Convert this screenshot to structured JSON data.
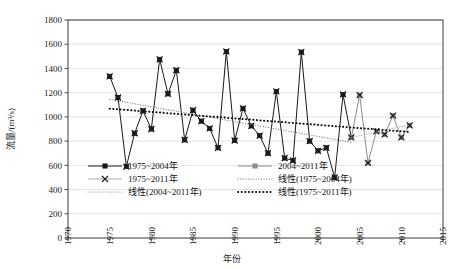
{
  "chart_data": {
    "type": "line",
    "title": "",
    "xlabel": "年份",
    "ylabel": "流量/(m³/s)",
    "xlim": [
      1970,
      2015
    ],
    "ylim": [
      0,
      1800
    ],
    "ytick_step": 200,
    "xtick_step": 5,
    "grid": true,
    "legend_position": "inside-lower-left",
    "xticks": [
      "1970",
      "1975",
      "1980",
      "1985",
      "1990",
      "1995",
      "2000",
      "2005",
      "2010",
      "2015"
    ],
    "yticks": [
      "0",
      "200",
      "400",
      "600",
      "800",
      "1000",
      "1200",
      "1400",
      "1600",
      "1800"
    ],
    "series": [
      {
        "name": "1975~2004年",
        "color": "#1a1a1a",
        "marker": "square",
        "x": [
          1975,
          1976,
          1977,
          1978,
          1979,
          1980,
          1981,
          1982,
          1983,
          1984,
          1985,
          1986,
          1987,
          1988,
          1989,
          1990,
          1991,
          1992,
          1993,
          1994,
          1995,
          1996,
          1997,
          1998,
          1999,
          2000,
          2001,
          2002,
          2003,
          2004
        ],
        "values": [
          1335,
          1160,
          590,
          865,
          1050,
          900,
          1475,
          1190,
          1385,
          810,
          1055,
          965,
          905,
          745,
          1540,
          805,
          1070,
          925,
          845,
          700,
          1210,
          660,
          640,
          1535,
          800,
          720,
          745,
          500,
          1185,
          830
        ]
      },
      {
        "name": "2004~2011年",
        "color": "#8c8c8c",
        "marker": "square",
        "x": [
          2004,
          2005,
          2006,
          2007,
          2008,
          2009,
          2010,
          2011
        ],
        "values": [
          830,
          1180,
          620,
          880,
          855,
          1010,
          830,
          930
        ]
      },
      {
        "name": "1975~2011年",
        "color": "#1a1a1a",
        "marker": "x",
        "x": [
          1975,
          1976,
          1977,
          1978,
          1979,
          1980,
          1981,
          1982,
          1983,
          1984,
          1985,
          1986,
          1987,
          1988,
          1989,
          1990,
          1991,
          1992,
          1993,
          1994,
          1995,
          1996,
          1997,
          1998,
          1999,
          2000,
          2001,
          2002,
          2003,
          2004,
          2005,
          2006,
          2007,
          2008,
          2009,
          2010,
          2011
        ],
        "values": [
          1335,
          1160,
          590,
          865,
          1050,
          900,
          1475,
          1190,
          1385,
          810,
          1055,
          965,
          905,
          745,
          1540,
          805,
          1070,
          925,
          845,
          700,
          1210,
          660,
          640,
          1535,
          800,
          720,
          745,
          500,
          1185,
          830,
          1180,
          620,
          880,
          855,
          1010,
          830,
          930
        ]
      }
    ],
    "trendlines": [
      {
        "name": "线性(1975~2004年)",
        "style": "fine-dotted",
        "color": "#6e6e6e",
        "x_start": 1975,
        "y_start": 1145,
        "x_end": 2004,
        "y_end": 790
      },
      {
        "name": "线性(2004~2011年)",
        "style": "fine-dotted",
        "color": "#9a9a9a",
        "x_start": 2004,
        "y_start": 830,
        "x_end": 2011,
        "y_end": 935
      },
      {
        "name": "线性(1975~2011年)",
        "style": "bold-dotted",
        "color": "#111111",
        "x_start": 1975,
        "y_start": 1068,
        "x_end": 2011,
        "y_end": 875
      }
    ],
    "legend": [
      {
        "label": "1975~2004年",
        "kind": "line-marker-square",
        "color": "#1a1a1a"
      },
      {
        "label": "2004~2011年",
        "kind": "marker-square-gray",
        "color": "#8c8c8c"
      },
      {
        "label": "1975~2011年",
        "kind": "marker-x",
        "color": "#1a1a1a"
      },
      {
        "label": "线性(1975~2004年)",
        "kind": "fine-dotted",
        "color": "#6e6e6e"
      },
      {
        "label": "线性(2004~2011年)",
        "kind": "fine-dotted",
        "color": "#9a9a9a"
      },
      {
        "label": "线性(1975~2011年)",
        "kind": "bold-dotted",
        "color": "#111111"
      }
    ]
  }
}
